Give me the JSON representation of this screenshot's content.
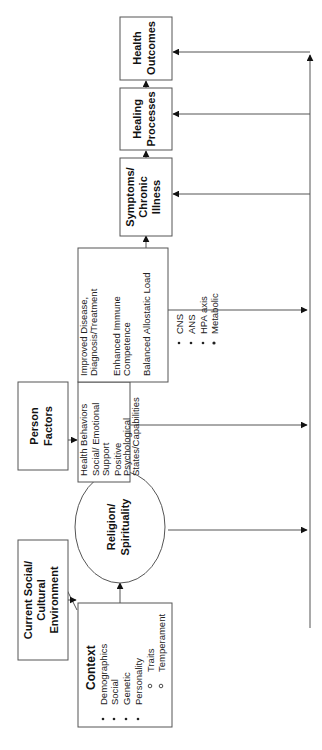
{
  "diagram": {
    "orientation": "rotated-90-ccw",
    "context": {
      "title": "Context",
      "items": [
        "Demographics",
        "Social",
        "Genetic",
        "Personality"
      ],
      "sub_items": [
        "Traits",
        "Temperament"
      ]
    },
    "environment": {
      "lines": [
        "Current Social/",
        "Cultural",
        "Environment"
      ]
    },
    "religion": {
      "lines": [
        "Religion/",
        "Spirituality"
      ]
    },
    "person_factors": {
      "lines": [
        "Person",
        "Factors"
      ]
    },
    "mediators": {
      "items": [
        [
          "Health Behaviors"
        ],
        [
          "Social/ Emotional",
          "Support"
        ],
        [
          "Positive",
          "Psychological",
          "States/Capabilities"
        ]
      ]
    },
    "pathways": {
      "items": [
        [
          "Improved Disease,",
          "Diagnosis/Treatment"
        ],
        [
          "Enhanced Immune",
          "Competence"
        ],
        [
          "Balanced Allostatic Load"
        ]
      ],
      "allostatic_items": [
        "CNS",
        "ANS",
        "HPA axis",
        "Metabolic"
      ]
    },
    "symptoms": {
      "lines": [
        "Symptoms/",
        "Chronic",
        "Illness"
      ]
    },
    "healing": {
      "lines": [
        "Healing",
        "Processes"
      ]
    },
    "outcomes": {
      "lines": [
        "Health",
        "Outcomes"
      ]
    },
    "colors": {
      "stroke": "#555555",
      "text": "#111111",
      "background": "#ffffff"
    }
  }
}
